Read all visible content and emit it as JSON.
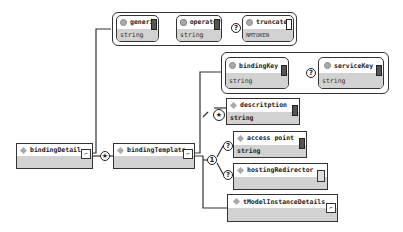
{
  "diagram": {
    "root": {
      "name": "bindingDetail"
    },
    "root_attributes": [
      {
        "name": "generic",
        "type": "string",
        "optional": false
      },
      {
        "name": "operator",
        "type": "string",
        "optional": false
      },
      {
        "name": "truncated",
        "type": "NMTOKEN",
        "optional": true
      }
    ],
    "child": {
      "name": "bindingTemplate",
      "cardinality": "*"
    },
    "child_attributes": [
      {
        "name": "bindingKey",
        "type": "string",
        "optional": false
      },
      {
        "name": "serviceKey",
        "type": "string",
        "optional": true
      }
    ],
    "sequence": [
      {
        "name": "descritption",
        "type": "string",
        "cardinality": "*"
      },
      {
        "name": "choice",
        "cardinality": "1",
        "options": [
          {
            "name": "access point",
            "type": "string",
            "optional": true
          },
          {
            "name": "hostingRedirector",
            "type": "",
            "optional": true
          }
        ]
      },
      {
        "name": "tModelInstanceDetails",
        "type": ""
      }
    ],
    "symbols": {
      "many": "★",
      "optional": "?",
      "one": "1",
      "expand": "⌐"
    }
  }
}
